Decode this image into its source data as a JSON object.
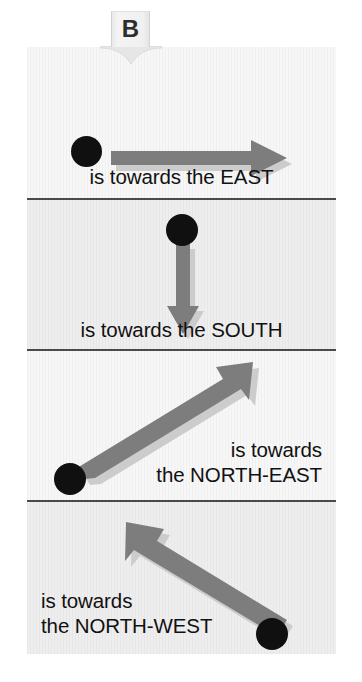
{
  "figure": {
    "label": "B",
    "background_color": "#ffffff",
    "card_color": "#f2f2f2",
    "arrow_color": "#7d7d7d",
    "arrow_shadow_color": "#c9c9c9",
    "dot_color": "#101010",
    "divider_color": "#4a4a4a",
    "text_color": "#111111"
  },
  "panels": [
    {
      "id": "east",
      "caption": "is towards the EAST",
      "direction": "east",
      "arrow_from": [
        118,
        119
      ],
      "arrow_to": [
        294,
        119
      ],
      "dot": [
        101,
        119
      ],
      "shade": "light"
    },
    {
      "id": "south",
      "caption": "is towards the SOUTH",
      "direction": "south",
      "arrow_from": [
        181,
        252
      ],
      "arrow_to": [
        181,
        323
      ],
      "dot": [
        181,
        228
      ],
      "shade": "shade"
    },
    {
      "id": "north-east",
      "caption": "is towards\nthe NORTH-EAST",
      "direction": "north-east",
      "arrow_from": [
        92,
        463
      ],
      "arrow_to": [
        240,
        371
      ],
      "dot": [
        70,
        478
      ],
      "shade": "light"
    },
    {
      "id": "north-west",
      "caption": "is towards\nthe NORTH-WEST",
      "direction": "north-west",
      "arrow_from": [
        247,
        613
      ],
      "arrow_to": [
        126,
        520
      ],
      "dot": [
        272,
        618
      ],
      "shade": "shade"
    }
  ]
}
